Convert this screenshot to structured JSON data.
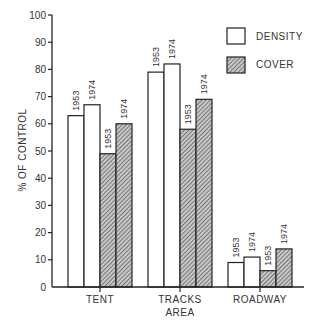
{
  "chart_data": {
    "type": "bar",
    "title": "",
    "xlabel": "AREA",
    "ylabel": "% OF CONTROL",
    "ylim": [
      0,
      100
    ],
    "yticks": [
      0,
      10,
      20,
      30,
      40,
      50,
      60,
      70,
      80,
      90,
      100
    ],
    "grid": false,
    "legend_position": "upper right",
    "categories": [
      "TENT",
      "TRACKS",
      "ROADWAY"
    ],
    "bar_year_labels": [
      "1953",
      "1974"
    ],
    "series": [
      {
        "name": "DENSITY",
        "style": "open",
        "values_1953": [
          63,
          79,
          9
        ],
        "values_1974": [
          67,
          82,
          11
        ]
      },
      {
        "name": "COVER",
        "style": "hatched",
        "values_1953": [
          49,
          58,
          6
        ],
        "values_1974": [
          60,
          69,
          14
        ]
      }
    ]
  },
  "legend": {
    "density_label": "DENSITY",
    "cover_label": "COVER"
  },
  "axes": {
    "x_title": "AREA",
    "y_title": "% OF CONTROL"
  },
  "colors": {
    "line": "#222222",
    "density_fill": "#ffffff",
    "cover_fill": "#bdbdbd",
    "hatch": "#333333"
  }
}
